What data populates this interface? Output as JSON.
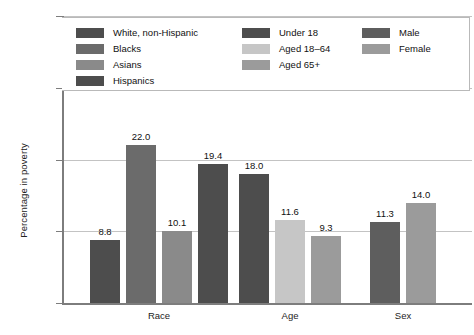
{
  "chart_data": {
    "type": "bar",
    "title": "",
    "xlabel": "",
    "ylabel": "Percentage in poverty",
    "ylim": [
      0,
      40
    ],
    "yticks": [
      "0",
      "10%",
      "20%",
      "30%",
      "40%"
    ],
    "ytick_values": [
      0,
      10,
      20,
      30,
      40
    ],
    "grid": true,
    "legend_position": "top",
    "categories": [
      "Race",
      "Age",
      "Sex"
    ],
    "groups": [
      {
        "category": "Race",
        "bars": [
          {
            "label": "White, non-Hispanic",
            "value": 8.8,
            "value_text": "8.8",
            "color": "#4d4d4d"
          },
          {
            "label": "Blacks",
            "value": 22.0,
            "value_text": "22.0",
            "color": "#6b6b6b"
          },
          {
            "label": "Asians",
            "value": 10.1,
            "value_text": "10.1",
            "color": "#8a8a8a"
          },
          {
            "label": "Hispanics",
            "value": 19.4,
            "value_text": "19.4",
            "color": "#4d4d4d"
          }
        ]
      },
      {
        "category": "Age",
        "bars": [
          {
            "label": "Under 18",
            "value": 18.0,
            "value_text": "18.0",
            "color": "#4d4d4d"
          },
          {
            "label": "Aged 18–64",
            "value": 11.6,
            "value_text": "11.6",
            "color": "#c6c6c6"
          },
          {
            "label": "Aged 65+",
            "value": 9.3,
            "value_text": "9.3",
            "color": "#9b9b9b"
          }
        ]
      },
      {
        "category": "Sex",
        "bars": [
          {
            "label": "Male",
            "value": 11.3,
            "value_text": "11.3",
            "color": "#5e5e5e"
          },
          {
            "label": "Female",
            "value": 14.0,
            "value_text": "14.0",
            "color": "#9b9b9b"
          }
        ]
      }
    ],
    "legend": {
      "columns": [
        {
          "items": [
            {
              "label": "White, non-Hispanic",
              "color": "#4d4d4d"
            },
            {
              "label": "Blacks",
              "color": "#6b6b6b"
            },
            {
              "label": "Asians",
              "color": "#8a8a8a"
            },
            {
              "label": "Hispanics",
              "color": "#4d4d4d"
            }
          ]
        },
        {
          "items": [
            {
              "label": "Under 18",
              "color": "#4d4d4d"
            },
            {
              "label": "Aged 18–64",
              "color": "#c6c6c6"
            },
            {
              "label": "Aged 65+",
              "color": "#9b9b9b"
            }
          ]
        },
        {
          "items": [
            {
              "label": "Male",
              "color": "#5e5e5e"
            },
            {
              "label": "Female",
              "color": "#9b9b9b"
            }
          ]
        }
      ]
    },
    "colors": {
      "axis": "#7d7d7d",
      "grid": "#c3c3c3",
      "text": "#1a1a1a",
      "background": "#ffffff",
      "legend_border": "#b9b9b9"
    }
  }
}
